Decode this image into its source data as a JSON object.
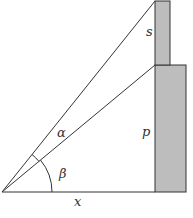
{
  "diagram": {
    "type": "geometry-angle-of-elevation",
    "colors": {
      "line": "#333333",
      "column_fill": "#bdbdbd",
      "column_stroke": "#333333",
      "background": "#ffffff"
    },
    "labels": {
      "s": "s",
      "alpha": "α",
      "p": "p",
      "beta": "β",
      "x": "x"
    }
  }
}
